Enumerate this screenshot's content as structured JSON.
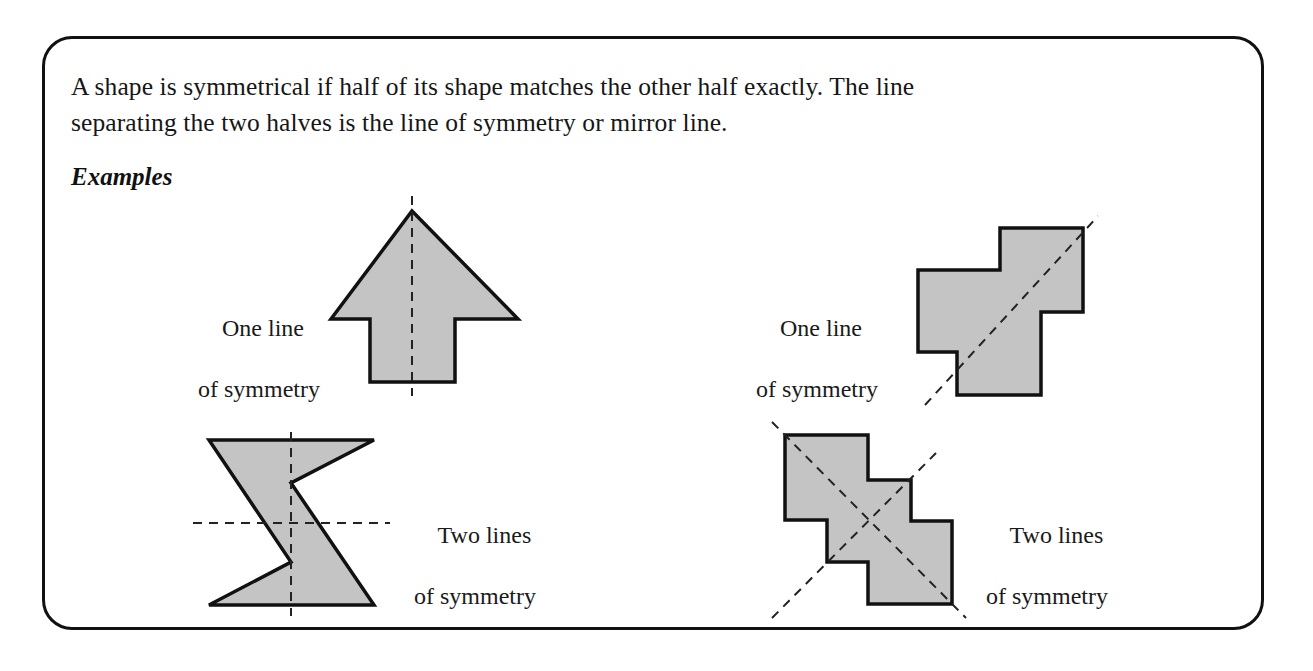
{
  "card": {
    "border_color": "#111111",
    "background": "#ffffff"
  },
  "intro": {
    "line1": "A shape is symmetrical if half of its shape matches the other half exactly. The line",
    "line2": "separating the two halves is the line of symmetry or mirror line."
  },
  "examples_heading": "Examples",
  "shape_style": {
    "fill": "#c4c4c4",
    "stroke": "#111111",
    "dash_color": "#222222"
  },
  "examples": [
    {
      "id": "arrow",
      "shape_name": "up-arrow",
      "label_line1": "One line",
      "label_line2": "of symmetry",
      "lines_of_symmetry": 1,
      "symmetry_line_orientation": "vertical"
    },
    {
      "id": "step-hexomino-top-right",
      "shape_name": "stepped-polygon",
      "label_line1": "One line",
      "label_line2": "of symmetry",
      "lines_of_symmetry": 1,
      "symmetry_line_orientation": "diagonal"
    },
    {
      "id": "bowtie",
      "shape_name": "bowtie",
      "label_line1": "Two lines",
      "label_line2": "of symmetry",
      "lines_of_symmetry": 2,
      "symmetry_line_orientation": "vertical-and-horizontal"
    },
    {
      "id": "step-hexomino-bottom-right",
      "shape_name": "stepped-polygon",
      "label_line1": "Two lines",
      "label_line2": "of symmetry",
      "lines_of_symmetry": 2,
      "symmetry_line_orientation": "two-diagonals"
    }
  ]
}
